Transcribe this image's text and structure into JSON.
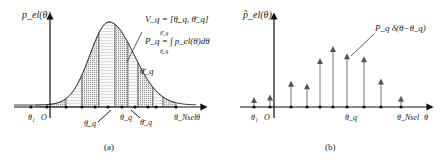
{
  "panel_a": {
    "caption": "(a)",
    "y_label": "p_el(θ)",
    "x_label": "θ",
    "equation_v": "V_q = [θ̲_q, θ̄_q]",
    "equation_p": "P_q = ∫ p_el(θ)dθ",
    "integral_lower": "θ̲_q",
    "integral_upper": "θ̄_q",
    "label_theta_upper_bar": "θ̄_q",
    "tick_labels": {
      "theta1": "θ₁",
      "origin": "O",
      "theta_lower": "θ̲_q",
      "theta_q": "θ_q",
      "theta_upper": "θ̄_q",
      "theta_nsel": "θ_Nsel"
    },
    "sample_points": [
      -2,
      0,
      1,
      2,
      3,
      4,
      5,
      6,
      7,
      8,
      9,
      10
    ],
    "curve": {
      "type": "gaussian-skewed",
      "peak_at": 4.7
    }
  },
  "panel_b": {
    "caption": "(b)",
    "y_label": "p̃_el(θ)",
    "x_label": "θ",
    "annotation": "P_q δ(θ−θ_q)",
    "tick_labels": {
      "theta1": "θ₁",
      "origin": "O",
      "theta_q": "θ_q",
      "theta_nsel": "θ_Nsel"
    },
    "impulses": [
      {
        "pos": -1,
        "weight": 0.15
      },
      {
        "pos": 0,
        "weight": 0.19
      },
      {
        "pos": 1,
        "weight": 0.42
      },
      {
        "pos": 2,
        "weight": 0.38
      },
      {
        "pos": 3,
        "weight": 0.8
      },
      {
        "pos": 4,
        "weight": 1.0
      },
      {
        "pos": 5,
        "weight": 0.88
      },
      {
        "pos": 6,
        "weight": 0.83
      },
      {
        "pos": 7,
        "weight": 0.46
      },
      {
        "pos": 8.5,
        "weight": 0.17
      }
    ]
  }
}
